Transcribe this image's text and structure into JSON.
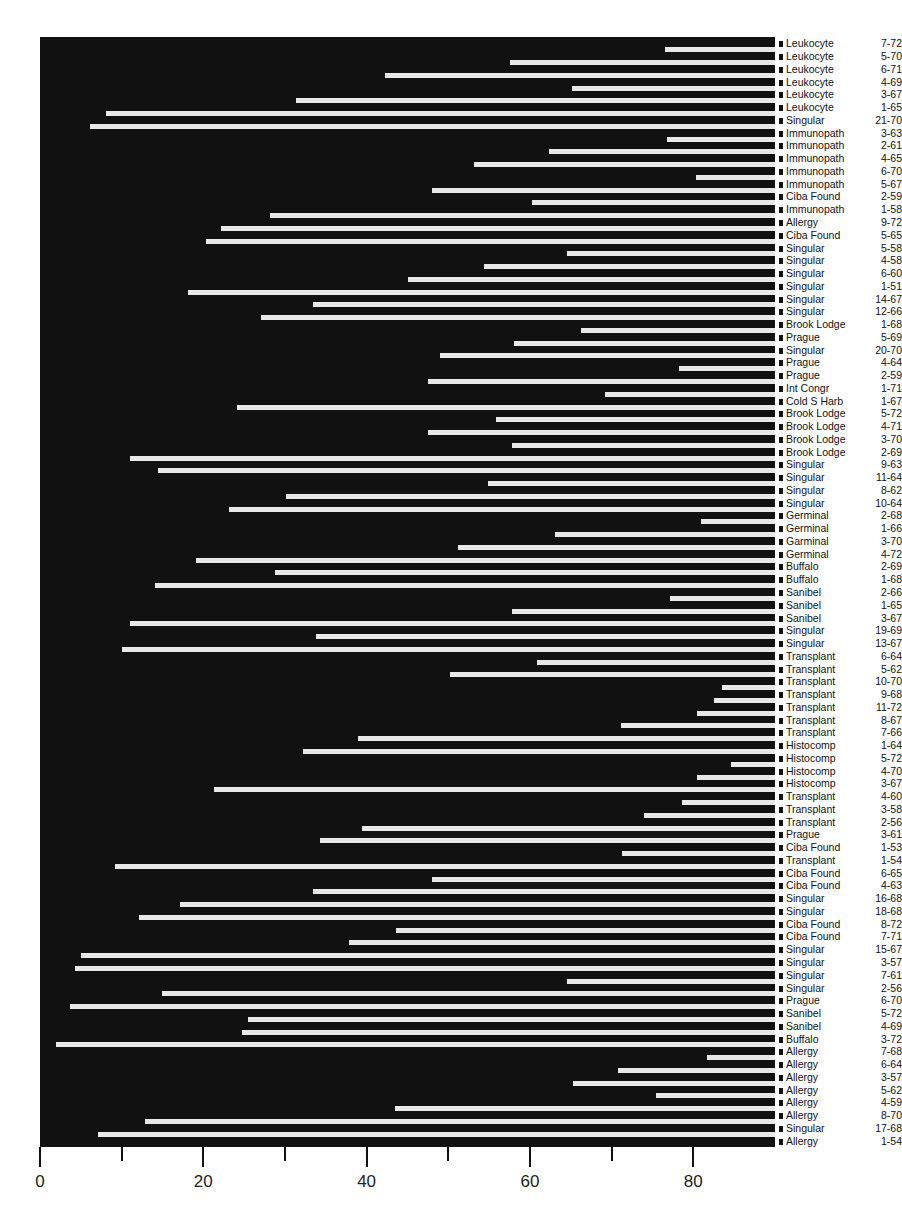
{
  "chart_data": {
    "type": "dendrogram-bar",
    "title": "",
    "xlabel": "",
    "ylabel": "",
    "xlim": [
      0,
      90
    ],
    "x_ticks": [
      0,
      10,
      20,
      30,
      40,
      50,
      60,
      70,
      80
    ],
    "x_tick_labels": [
      "0",
      "20",
      "40",
      "60",
      "80"
    ],
    "x_labeled_ticks": [
      0,
      20,
      40,
      60,
      80
    ],
    "grid": false,
    "colors": {
      "background": "#111111",
      "gap": "#e8e8e8",
      "text": "#111111"
    },
    "leaves": [
      {
        "name": "Leukocyte",
        "code": "7-72"
      },
      {
        "name": "Leukocyte",
        "code": "5-70"
      },
      {
        "name": "Leukocyte",
        "code": "6-71"
      },
      {
        "name": "Leukocyte",
        "code": "4-69"
      },
      {
        "name": "Leukocyte",
        "code": "3-67"
      },
      {
        "name": "Leukocyte",
        "code": "1-65"
      },
      {
        "name": "Singular",
        "code": "21-70"
      },
      {
        "name": "Immunopath",
        "code": "3-63"
      },
      {
        "name": "Immunopath",
        "code": "2-61"
      },
      {
        "name": "Immunopath",
        "code": "4-65"
      },
      {
        "name": "Immunopath",
        "code": "6-70"
      },
      {
        "name": "Immunopath",
        "code": "5-67"
      },
      {
        "name": "Ciba Found",
        "code": "2-59"
      },
      {
        "name": "Immunopath",
        "code": "1-58"
      },
      {
        "name": "Allergy",
        "code": "9-72"
      },
      {
        "name": "Ciba Found",
        "code": "5-65"
      },
      {
        "name": "Singular",
        "code": "5-58"
      },
      {
        "name": "Singular",
        "code": "4-58"
      },
      {
        "name": "Singular",
        "code": "6-60"
      },
      {
        "name": "Singular",
        "code": "1-51"
      },
      {
        "name": "Singular",
        "code": "14-67"
      },
      {
        "name": "Singular",
        "code": "12-66"
      },
      {
        "name": "Brook Lodge",
        "code": "1-68"
      },
      {
        "name": "Prague",
        "code": "5-69"
      },
      {
        "name": "Singular",
        "code": "20-70"
      },
      {
        "name": "Prague",
        "code": "4-64"
      },
      {
        "name": "Prague",
        "code": "2-59"
      },
      {
        "name": "Int Congr",
        "code": "1-71"
      },
      {
        "name": "Cold S Harb",
        "code": "1-67"
      },
      {
        "name": "Brook Lodge",
        "code": "5-72"
      },
      {
        "name": "Brook Lodge",
        "code": "4-71"
      },
      {
        "name": "Brook Lodge",
        "code": "3-70"
      },
      {
        "name": "Brook Lodge",
        "code": "2-69"
      },
      {
        "name": "Singular",
        "code": "9-63"
      },
      {
        "name": "Singular",
        "code": "11-64"
      },
      {
        "name": "Singular",
        "code": "8-62"
      },
      {
        "name": "Singular",
        "code": "10-64"
      },
      {
        "name": "Germinal",
        "code": "2-68"
      },
      {
        "name": "Germinal",
        "code": "1-66"
      },
      {
        "name": "Garminal",
        "code": "3-70"
      },
      {
        "name": "Germinal",
        "code": "4-72"
      },
      {
        "name": "Buffalo",
        "code": "2-69"
      },
      {
        "name": "Buffalo",
        "code": "1-68"
      },
      {
        "name": "Sanibel",
        "code": "2-66"
      },
      {
        "name": "Sanibel",
        "code": "1-65"
      },
      {
        "name": "Sanibel",
        "code": "3-67"
      },
      {
        "name": "Singular",
        "code": "19-69"
      },
      {
        "name": "Singular",
        "code": "13-67"
      },
      {
        "name": "Transplant",
        "code": "6-64"
      },
      {
        "name": "Transplant",
        "code": "5-62"
      },
      {
        "name": "Transplant",
        "code": "10-70"
      },
      {
        "name": "Transplant",
        "code": "9-68"
      },
      {
        "name": "Transplant",
        "code": "11-72"
      },
      {
        "name": "Transplant",
        "code": "8-67"
      },
      {
        "name": "Transplant",
        "code": "7-66"
      },
      {
        "name": "Histocomp",
        "code": "1-64"
      },
      {
        "name": "Histocomp",
        "code": "5-72"
      },
      {
        "name": "Histocomp",
        "code": "4-70"
      },
      {
        "name": "Histocomp",
        "code": "3-67"
      },
      {
        "name": "Transplant",
        "code": "4-60"
      },
      {
        "name": "Transplant",
        "code": "3-58"
      },
      {
        "name": "Transplant",
        "code": "2-56"
      },
      {
        "name": "Prague",
        "code": "3-61"
      },
      {
        "name": "Ciba Found",
        "code": "1-53"
      },
      {
        "name": "Transplant",
        "code": "1-54"
      },
      {
        "name": "Ciba Found",
        "code": "6-65"
      },
      {
        "name": "Ciba Found",
        "code": "4-63"
      },
      {
        "name": "Singular",
        "code": "16-68"
      },
      {
        "name": "Singular",
        "code": "18-68"
      },
      {
        "name": "Ciba Found",
        "code": "8-72"
      },
      {
        "name": "Ciba Found",
        "code": "7-71"
      },
      {
        "name": "Singular",
        "code": "15-67"
      },
      {
        "name": "Singular",
        "code": "3-57"
      },
      {
        "name": "Singular",
        "code": "7-61"
      },
      {
        "name": "Singular",
        "code": "2-56"
      },
      {
        "name": "Prague",
        "code": "6-70"
      },
      {
        "name": "Sanibel",
        "code": "5-72"
      },
      {
        "name": "Sanibel",
        "code": "4-69"
      },
      {
        "name": "Buffalo",
        "code": "3-72"
      },
      {
        "name": "Allergy",
        "code": "7-68"
      },
      {
        "name": "Allergy",
        "code": "6-64"
      },
      {
        "name": "Allergy",
        "code": "3-57"
      },
      {
        "name": "Allergy",
        "code": "5-62"
      },
      {
        "name": "Allergy",
        "code": "4-59"
      },
      {
        "name": "Allergy",
        "code": "8-70"
      },
      {
        "name": "Singular",
        "code": "17-68"
      },
      {
        "name": "Allergy",
        "code": "1-54"
      }
    ],
    "merge_heights": [
      76.5,
      57.6,
      42.2,
      65.1,
      31.4,
      8.1,
      6.1,
      76.8,
      62.3,
      53.2,
      80.4,
      48.0,
      60.2,
      28.2,
      22.2,
      20.3,
      64.5,
      54.4,
      45.1,
      18.1,
      33.4,
      27.1,
      66.2,
      58.1,
      49.0,
      78.2,
      47.5,
      69.2,
      24.1,
      55.8,
      47.5,
      57.8,
      11.0,
      14.5,
      54.9,
      30.1,
      23.2,
      80.9,
      63.1,
      51.2,
      19.1,
      28.8,
      14.1,
      77.1,
      57.8,
      11.0,
      33.8,
      10.0,
      60.9,
      50.2,
      83.5,
      82.5,
      80.5,
      71.2,
      38.9,
      32.2,
      84.6,
      80.5,
      21.3,
      78.6,
      74.0,
      39.4,
      34.3,
      71.3,
      9.2,
      48.0,
      33.4,
      17.2,
      12.1,
      43.6,
      37.8,
      5.0,
      4.3,
      64.5,
      14.9,
      3.7,
      25.5,
      24.8,
      2.0,
      81.7,
      70.8,
      65.3,
      75.4,
      43.5,
      12.9,
      7.1
    ]
  }
}
